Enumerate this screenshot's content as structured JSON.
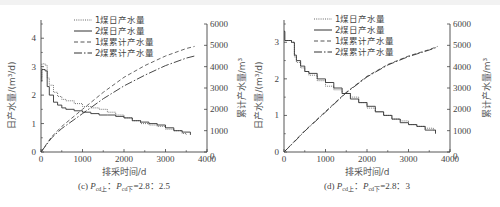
{
  "chart_data": [
    {
      "panel": "c",
      "type": "line",
      "caption": "(c) P_cd上：P_cd下=2.8：2.5",
      "caption_parts": {
        "prefix": "(c) ",
        "p1": "P",
        "s1": "cd上",
        "sep": "：",
        "p2": "P",
        "s2": "cd下",
        "ratio": "=2.8：2.5"
      },
      "xlabel": "排采时间/d",
      "ylabel_left": "日产水量/(m³/d)",
      "ylabel_right": "累计产水量/m³",
      "xlim": [
        0,
        4000
      ],
      "ylim_left": [
        0,
        4.5
      ],
      "ylim_right": [
        0,
        6000
      ],
      "xticks": [
        "0",
        "1000",
        "2000",
        "3000",
        "4000"
      ],
      "yticks_left": [
        "0",
        "1",
        "2",
        "3",
        "4"
      ],
      "yticks_right": [
        "0",
        "1000",
        "2000",
        "3000",
        "4000",
        "5000",
        "6000"
      ],
      "grid": false,
      "legend_position": "upper center",
      "legend": [
        "1煤日产水量",
        "2煤日产水量",
        "1煤累计产水量",
        "2煤累计产水量"
      ],
      "series": [
        {
          "name": "1煤日产水量",
          "axis": "left",
          "style": "dotted",
          "x": [
            0,
            20,
            50,
            100,
            150,
            200,
            300,
            400,
            500,
            600,
            800,
            1000,
            1200,
            1400,
            1600,
            1800,
            2000,
            2200,
            2400,
            2600,
            2800,
            3000,
            3200,
            3400,
            3500
          ],
          "y": [
            2.6,
            3.1,
            3.1,
            3.05,
            2.6,
            2.35,
            2.1,
            1.95,
            1.85,
            1.8,
            1.7,
            1.6,
            1.55,
            1.5,
            1.4,
            1.3,
            1.2,
            1.1,
            1.0,
            0.95,
            0.9,
            0.8,
            0.75,
            0.65,
            0.6
          ]
        },
        {
          "name": "2煤日产水量",
          "axis": "left",
          "style": "solid",
          "x": [
            0,
            20,
            50,
            100,
            150,
            200,
            300,
            400,
            500,
            600,
            800,
            1000,
            1200,
            1400,
            1600,
            1800,
            2000,
            2200,
            2400,
            2600,
            2800,
            3000,
            3200,
            3400,
            3600
          ],
          "y": [
            2.5,
            2.9,
            2.9,
            2.85,
            2.3,
            2.0,
            1.75,
            1.65,
            1.55,
            1.5,
            1.45,
            1.4,
            1.35,
            1.3,
            1.3,
            1.25,
            1.2,
            1.1,
            1.05,
            1.0,
            0.95,
            0.85,
            0.75,
            0.7,
            0.6
          ]
        },
        {
          "name": "1煤累计产水量",
          "axis": "right",
          "style": "dashed",
          "x": [
            0,
            250,
            500,
            1000,
            1500,
            2000,
            2500,
            3000,
            3500,
            3700
          ],
          "y": [
            0,
            700,
            1200,
            2000,
            2800,
            3500,
            4050,
            4500,
            4850,
            4950
          ]
        },
        {
          "name": "2煤累计产水量",
          "axis": "right",
          "style": "dashdot",
          "x": [
            0,
            250,
            500,
            1000,
            1500,
            2000,
            2500,
            3000,
            3500,
            3700
          ],
          "y": [
            0,
            650,
            1100,
            1800,
            2500,
            3100,
            3600,
            4050,
            4400,
            4500
          ]
        }
      ]
    },
    {
      "panel": "d",
      "type": "line",
      "caption": "(d) P_cd上：P_cd下=2.8：3",
      "caption_parts": {
        "prefix": "(d) ",
        "p1": "P",
        "s1": "cd上",
        "sep": "：",
        "p2": "P",
        "s2": "cd下",
        "ratio": "=2.8：3"
      },
      "xlabel": "排采时间/d",
      "ylabel_left": "日产水量/(m³/d)",
      "ylabel_right": "累计产水量/m³",
      "xlim": [
        0,
        4000
      ],
      "ylim_left": [
        0,
        3.5
      ],
      "ylim_right": [
        0,
        6000
      ],
      "xticks": [
        "0",
        "1000",
        "2000",
        "3000",
        "4000"
      ],
      "yticks_left": [
        "0",
        "1",
        "2",
        "3"
      ],
      "yticks_right": [
        "0",
        "1000",
        "2000",
        "3000",
        "4000",
        "5000",
        "6000"
      ],
      "grid": false,
      "legend_position": "upper left",
      "legend": [
        "1煤日产水量",
        "2煤日产水量",
        "1煤累计产水量",
        "2煤累计产水量"
      ],
      "series": [
        {
          "name": "1煤日产水量",
          "axis": "left",
          "style": "dotted",
          "x": [
            0,
            20,
            100,
            180,
            250,
            300,
            400,
            500,
            600,
            800,
            1000,
            1200,
            1400,
            1600,
            1800,
            2000,
            2200,
            2400,
            2600,
            2800,
            3000,
            3200,
            3400,
            3600,
            3650
          ],
          "y": [
            3.3,
            3.05,
            3.05,
            3.0,
            2.6,
            2.45,
            2.3,
            2.2,
            2.1,
            1.95,
            1.8,
            1.7,
            1.6,
            1.5,
            1.35,
            1.2,
            1.1,
            1.0,
            0.9,
            0.85,
            0.75,
            0.7,
            0.65,
            0.6,
            0.55
          ]
        },
        {
          "name": "2煤日产水量",
          "axis": "left",
          "style": "solid",
          "x": [
            0,
            20,
            100,
            180,
            250,
            300,
            400,
            500,
            600,
            800,
            1000,
            1200,
            1400,
            1600,
            1800,
            2000,
            2200,
            2400,
            2600,
            2800,
            3000,
            3200,
            3400,
            3600,
            3650
          ],
          "y": [
            3.3,
            3.05,
            3.05,
            3.0,
            2.65,
            2.5,
            2.35,
            2.2,
            2.15,
            2.0,
            1.9,
            1.75,
            1.6,
            1.45,
            1.35,
            1.25,
            1.1,
            1.0,
            0.9,
            0.8,
            0.75,
            0.7,
            0.6,
            0.6,
            0.5
          ]
        },
        {
          "name": "1煤累计产水量",
          "axis": "right",
          "style": "dashed",
          "x": [
            0,
            250,
            500,
            1000,
            1500,
            2000,
            2500,
            3000,
            3500,
            3700
          ],
          "y": [
            0,
            500,
            1000,
            1900,
            2800,
            3550,
            4100,
            4500,
            4800,
            4950
          ]
        },
        {
          "name": "2煤累计产水量",
          "axis": "right",
          "style": "dashdot",
          "x": [
            0,
            250,
            500,
            1000,
            1500,
            2000,
            2500,
            3000,
            3500,
            3700
          ],
          "y": [
            0,
            480,
            980,
            1870,
            2780,
            3520,
            4080,
            4470,
            4780,
            4920
          ]
        }
      ]
    }
  ],
  "panels": {
    "c": {
      "legend": [
        "1煤日产水量",
        "2煤日产水量",
        "1煤累计产水量",
        "2煤累计产水量"
      ],
      "xlabel": "排采时间/d",
      "ylabel_left": "日产水量/(m³/d)",
      "ylabel_right": "累计产水量/m³",
      "xticks": [
        "0",
        "1000",
        "2000",
        "3000",
        "4000"
      ],
      "yticks_left": [
        "0",
        "1",
        "2",
        "3",
        "4"
      ],
      "yticks_right": [
        "0",
        "1000",
        "2000",
        "3000",
        "4000",
        "5000",
        "6000"
      ],
      "cap_prefix": "(c) ",
      "cap_p": "P",
      "cap_s1": "cd上",
      "cap_sep": "：",
      "cap_s2": "cd下",
      "cap_ratio": "=2.8：2.5"
    },
    "d": {
      "legend": [
        "1煤日产水量",
        "2煤日产水量",
        "1煤累计产水量",
        "2煤累计产水量"
      ],
      "xlabel": "排采时间/d",
      "ylabel_left": "日产水量/(m³/d)",
      "ylabel_right": "累计产水量/m³",
      "xticks": [
        "0",
        "1000",
        "2000",
        "3000",
        "4000"
      ],
      "yticks_left": [
        "0",
        "1",
        "2",
        "3"
      ],
      "yticks_right": [
        "0",
        "1000",
        "2000",
        "3000",
        "4000",
        "5000",
        "6000"
      ],
      "cap_prefix": "(d) ",
      "cap_p": "P",
      "cap_s1": "cd上",
      "cap_sep": "：",
      "cap_s2": "cd下",
      "cap_ratio": "=2.8：3"
    }
  }
}
